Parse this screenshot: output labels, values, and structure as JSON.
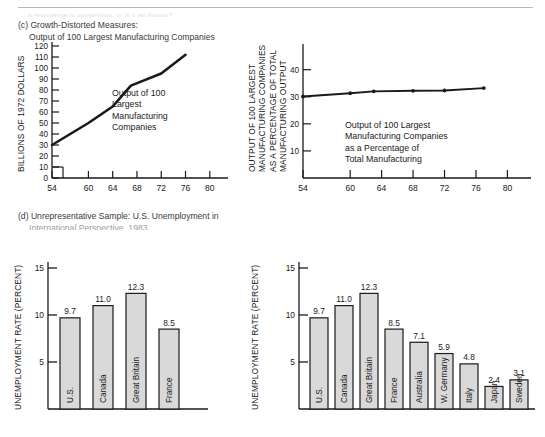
{
  "document": {
    "ghost_text": "a resurgence in competition, or is it an illusion?",
    "sections": [
      {
        "id": "c",
        "line1": "(c) Growth-Distorted Measures:",
        "line2": "Output of 100 Largest Manufacturing Companies"
      },
      {
        "id": "d",
        "line1": "(d) Unrepresentative Sample: U.S. Unemployment in",
        "line2": "International Perspective, 1983"
      }
    ]
  },
  "chart_data": [
    {
      "id": "output-absolute",
      "type": "line",
      "title": "Output of 100 Largest Manufacturing Companies",
      "ylabel": "BILLIONS OF 1972 DOLLARS",
      "xlabel": "",
      "annotation": [
        "Output of 100",
        "Largest",
        "Manufacturing",
        "Companies"
      ],
      "yticks": [
        0,
        10,
        20,
        30,
        40,
        50,
        60,
        70,
        80,
        90,
        100,
        110,
        120
      ],
      "ylim": [
        0,
        120
      ],
      "xticks": [
        54,
        60,
        64,
        68,
        72,
        76,
        80
      ],
      "xlim": [
        54,
        83
      ],
      "grid": false,
      "x": [
        54,
        60,
        64,
        67,
        72,
        76
      ],
      "values": [
        30,
        50,
        65,
        84,
        95,
        112
      ]
    },
    {
      "id": "output-percentage",
      "type": "line",
      "title": "Output of 100 Largest Manufacturing Companies as a Percentage of Total Manufacturing",
      "ylabel": "OUTPUT OF 100 LARGEST MANUFACTURING COMPANIES AS A PERCENTAGE OF TOTAL MANUFACTURING OUTPUT",
      "ylabel_lines": [
        "OUTPUT OF 100 LARGEST",
        "MANUFACTURING COMPANIES",
        "AS A PERCENTAGE OF TOTAL",
        "MANUFACTURING OUTPUT"
      ],
      "xlabel": "",
      "annotation": [
        "Output of 100 Largest",
        "Manufacturing Companies",
        "as a Percentage of",
        "Total Manufacturing"
      ],
      "yticks": [
        10,
        20,
        30,
        40
      ],
      "ylim": [
        0,
        48
      ],
      "xticks": [
        54,
        60,
        64,
        68,
        72,
        76,
        80
      ],
      "xlim": [
        54,
        83
      ],
      "grid": false,
      "x": [
        54,
        60,
        63,
        68,
        72,
        77
      ],
      "values": [
        30.1,
        31.3,
        32.0,
        32.2,
        32.3,
        33.2
      ]
    },
    {
      "id": "unemployment-4",
      "type": "bar",
      "title": "",
      "ylabel": "UNEMPLOYMENT RATE (PERCENT)",
      "xlabel": "",
      "yticks": [
        5,
        10,
        15
      ],
      "ylim": [
        0,
        15
      ],
      "grid": false,
      "categories": [
        "U.S.",
        "Canada",
        "Great Britain",
        "France"
      ],
      "values": [
        9.7,
        11.0,
        12.3,
        8.5
      ],
      "value_labels": [
        "9.7",
        "11.0",
        "12.3",
        "8.5"
      ]
    },
    {
      "id": "unemployment-9",
      "type": "bar",
      "title": "",
      "ylabel": "UNEMPLOYMENT RATE (PERCENT)",
      "xlabel": "",
      "yticks": [
        5,
        10,
        15
      ],
      "ylim": [
        0,
        15
      ],
      "grid": false,
      "categories": [
        "U.S.",
        "Canada",
        "Great Britain",
        "France",
        "Australia",
        "W. Germany",
        "Italy",
        "Japan",
        "Sweden"
      ],
      "values": [
        9.7,
        11.0,
        12.3,
        8.5,
        7.1,
        5.9,
        4.8,
        2.4,
        3.1
      ],
      "value_labels": [
        "9.7",
        "11.0",
        "12.3",
        "8.5",
        "7.1",
        "5.9",
        "4.8",
        "2.4",
        "3.1"
      ]
    }
  ],
  "colors": {
    "ink": "#1a1a1a",
    "bar_fill": "#d9d9d9",
    "caption": "#3a3a3a",
    "rule": "#b9b9b9"
  }
}
